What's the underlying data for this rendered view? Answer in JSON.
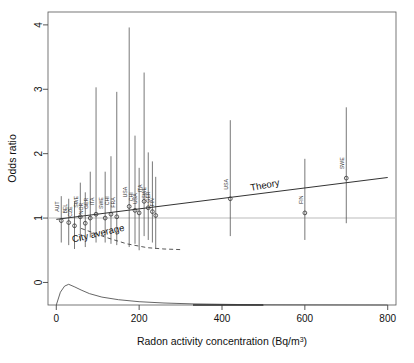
{
  "chart_data": {
    "type": "scatter",
    "title": "",
    "xlabel": "Radon activity concentration (Bq/m3)",
    "xlabel_base": "Radon activity concentration (Bq/m",
    "xlabel_sup": "3",
    "xlabel_tail": ")",
    "ylabel": "Odds ratio",
    "xlim": [
      -20,
      820
    ],
    "ylim": [
      -0.35,
      4.2
    ],
    "xticks": [
      0,
      200,
      400,
      600,
      800
    ],
    "yticks": [
      0,
      1,
      2,
      3,
      4
    ],
    "grid": false,
    "reference_line": {
      "y": 1,
      "color": "#bcbcbc",
      "label": ""
    },
    "annotations": [
      {
        "text": "Theory",
        "x": 470,
        "y": 1.42,
        "rotation": -11
      },
      {
        "text": "City average",
        "x": 40,
        "y": 0.62,
        "rotation": -13
      }
    ],
    "series": [
      {
        "name": "Theory",
        "type": "line",
        "color": "#333333",
        "x": [
          0,
          800
        ],
        "values": [
          0.98,
          1.63
        ]
      },
      {
        "name": "Odds ratio estimates with 95% CI",
        "type": "scatter",
        "color": "#555555",
        "points": [
          {
            "label": "AUT",
            "x": 12,
            "or": 0.96,
            "lo": 0.62,
            "hi": 1.34
          },
          {
            "label": "BEL",
            "x": 30,
            "or": 0.93,
            "lo": 0.58,
            "hi": 1.3
          },
          {
            "label": "CZE",
            "x": 44,
            "or": 0.88,
            "lo": 0.52,
            "hi": 1.26
          },
          {
            "label": "SWE",
            "x": 58,
            "or": 1.02,
            "lo": 0.64,
            "hi": 1.55
          },
          {
            "label": "NOR",
            "x": 70,
            "or": 0.92,
            "lo": 0.55,
            "hi": 1.4
          },
          {
            "label": "GER",
            "x": 82,
            "or": 1.0,
            "lo": 0.7,
            "hi": 1.72
          },
          {
            "label": "ITA",
            "x": 96,
            "or": 1.06,
            "lo": 0.62,
            "hi": 3.03
          },
          {
            "label": "SWE",
            "x": 118,
            "or": 1.0,
            "lo": 0.62,
            "hi": 1.72
          },
          {
            "label": "CHI",
            "x": 132,
            "or": 1.06,
            "lo": 0.6,
            "hi": 1.96
          },
          {
            "label": "FRA",
            "x": 146,
            "or": 1.02,
            "lo": 0.58,
            "hi": 2.96
          },
          {
            "label": "USA",
            "x": 176,
            "or": 1.18,
            "lo": 0.55,
            "hi": 3.96
          },
          {
            "label": "CHI",
            "x": 190,
            "or": 1.12,
            "lo": 0.6,
            "hi": 2.28
          },
          {
            "label": "USA",
            "x": 200,
            "or": 1.08,
            "lo": 0.5,
            "hi": 1.78
          },
          {
            "label": "ITA",
            "x": 212,
            "or": 1.26,
            "lo": 0.72,
            "hi": 3.26
          },
          {
            "label": "SWE",
            "x": 222,
            "or": 1.16,
            "lo": 0.66,
            "hi": 2.02
          },
          {
            "label": "GER",
            "x": 232,
            "or": 1.1,
            "lo": 0.62,
            "hi": 1.88
          },
          {
            "label": "FIN",
            "x": 240,
            "or": 1.04,
            "lo": 0.52,
            "hi": 1.64
          },
          {
            "label": "USA",
            "x": 420,
            "or": 1.3,
            "lo": 0.72,
            "hi": 2.52
          },
          {
            "label": "FIN",
            "x": 600,
            "or": 1.08,
            "lo": 0.66,
            "hi": 1.92
          },
          {
            "label": "SWE",
            "x": 700,
            "or": 1.62,
            "lo": 0.92,
            "hi": 2.72
          }
        ]
      },
      {
        "name": "City average dashed curve",
        "type": "line",
        "style": "dashed",
        "color": "#444444",
        "x": [
          60,
          120,
          170,
          220,
          260,
          300
        ],
        "values": [
          0.84,
          0.7,
          0.6,
          0.54,
          0.52,
          0.51
        ]
      },
      {
        "name": "Radon concentration density",
        "type": "area",
        "color": "#555555",
        "note": "lognormal density drawn below zero axis, peak near 30 Bq/m3",
        "x": [
          0,
          10,
          20,
          30,
          45,
          60,
          80,
          110,
          150,
          200,
          260,
          330,
          400,
          470,
          500,
          800
        ],
        "values": [
          0.0,
          0.58,
          0.86,
          0.94,
          0.82,
          0.68,
          0.52,
          0.36,
          0.24,
          0.15,
          0.09,
          0.05,
          0.03,
          0.015,
          0.01,
          0.0
        ]
      }
    ]
  }
}
